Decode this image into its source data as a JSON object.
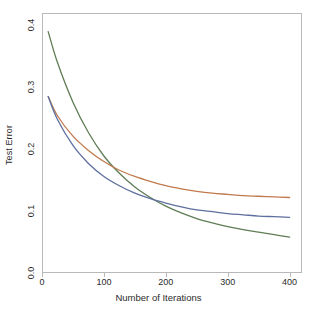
{
  "chart_data": {
    "type": "line",
    "title": "",
    "xlabel": "Number of Iterations",
    "ylabel": "Test Error",
    "xlim": [
      0,
      420
    ],
    "ylim": [
      0.0,
      0.42
    ],
    "xticks": [
      "0",
      "100",
      "200",
      "300",
      "400"
    ],
    "xtick_values": [
      0,
      100,
      200,
      300,
      400
    ],
    "yticks": [
      "0.0",
      "0.1",
      "0.2",
      "0.3",
      "0.4"
    ],
    "ytick_values": [
      0.0,
      0.1,
      0.2,
      0.3,
      0.4
    ],
    "grid": false,
    "legend": "none",
    "x": [
      10,
      25,
      50,
      75,
      100,
      125,
      150,
      175,
      200,
      225,
      250,
      275,
      300,
      325,
      350,
      375,
      400
    ],
    "series": [
      {
        "name": "green-curve",
        "color": "#5f7d55",
        "values": [
          0.39,
          0.34,
          0.276,
          0.227,
          0.189,
          0.161,
          0.139,
          0.122,
          0.108,
          0.097,
          0.088,
          0.081,
          0.075,
          0.07,
          0.066,
          0.062,
          0.058
        ]
      },
      {
        "name": "orange-curve",
        "color": "#c07a4e",
        "values": [
          0.285,
          0.254,
          0.221,
          0.198,
          0.18,
          0.166,
          0.156,
          0.148,
          0.141,
          0.136,
          0.132,
          0.129,
          0.127,
          0.125,
          0.124,
          0.123,
          0.122
        ]
      },
      {
        "name": "blue-curve",
        "color": "#5d6f9e",
        "values": [
          0.285,
          0.248,
          0.206,
          0.177,
          0.156,
          0.141,
          0.129,
          0.12,
          0.113,
          0.107,
          0.102,
          0.099,
          0.096,
          0.094,
          0.092,
          0.091,
          0.09
        ]
      }
    ],
    "colors": {
      "green": "#5f7d55",
      "orange": "#c07a4e",
      "blue": "#5d6f9e",
      "frame": "#b9b9b9",
      "text": "#2b2b2b",
      "background": "#ffffff"
    }
  }
}
